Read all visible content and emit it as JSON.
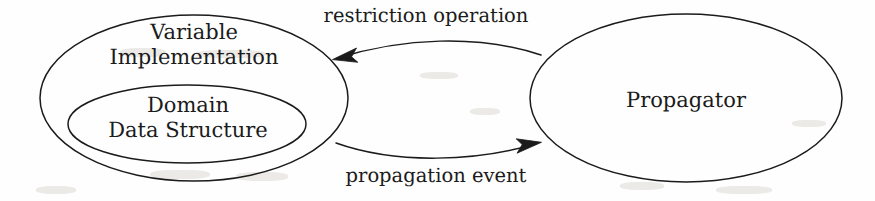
{
  "figure": {
    "type": "node-edge-diagram",
    "width": 875,
    "height": 201,
    "background_color": "#fefefe",
    "stroke_color": "#1b1b1b",
    "text_color": "#1b1b1b"
  },
  "nodes": {
    "variable_implementation": {
      "shape": "ellipse",
      "line_1": "Variable",
      "line_2": "Implementation",
      "cx": 194,
      "cy": 98,
      "rx": 154,
      "ry": 83
    },
    "domain_data_structure": {
      "shape": "ellipse",
      "line_1": "Domain",
      "line_2": "Data Structure",
      "cx": 187,
      "cy": 124,
      "rx": 119,
      "ry": 39
    },
    "propagator": {
      "shape": "ellipse",
      "label": "Propagator",
      "cx": 686,
      "cy": 98,
      "rx": 156,
      "ry": 84
    }
  },
  "edges": {
    "restriction_operation": {
      "label": "restriction operation",
      "from": "propagator",
      "to": "variable_implementation",
      "direction": "right-to-left",
      "arrowhead_at": {
        "x": 333,
        "y": 58
      }
    },
    "propagation_event": {
      "label": "propagation event",
      "from": "variable_implementation",
      "to": "propagator",
      "direction": "left-to-right",
      "arrowhead_at": {
        "x": 540,
        "y": 143
      }
    }
  }
}
